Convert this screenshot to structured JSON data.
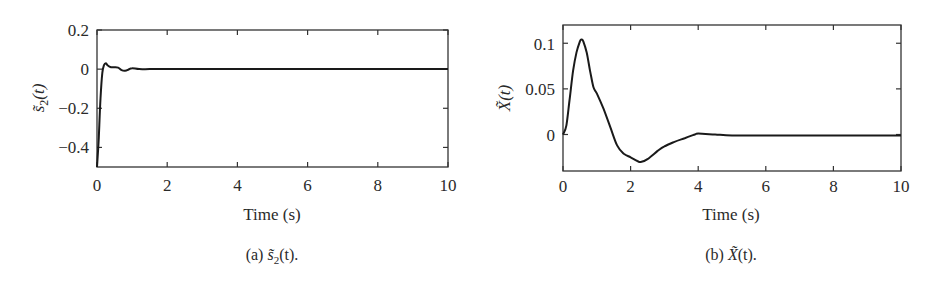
{
  "chart_data": [
    {
      "type": "line",
      "panel": "a",
      "caption": "(a) s̃2(t).",
      "caption_prefix": "(a)",
      "ylabel": "s̃2(t)",
      "xlabel": "Time (s)",
      "xlim": [
        0,
        10
      ],
      "ylim": [
        -0.5,
        0.2
      ],
      "xticks": [
        "0",
        "2",
        "4",
        "6",
        "8",
        "10"
      ],
      "yticks": [
        "0.2",
        "0",
        "-0.2",
        "-0.4"
      ],
      "grid": false,
      "series": [
        {
          "name": "s2_tilde",
          "x": [
            0,
            0.05,
            0.1,
            0.15,
            0.2,
            0.25,
            0.3,
            0.4,
            0.5,
            0.6,
            0.7,
            0.8,
            0.9,
            1.0,
            1.2,
            1.5,
            2,
            4,
            6,
            8,
            10
          ],
          "y": [
            -0.5,
            -0.35,
            -0.15,
            -0.02,
            0.02,
            0.03,
            0.02,
            0.01,
            0.01,
            0.008,
            -0.005,
            -0.008,
            -0.002,
            0.005,
            0.0,
            0.0,
            0.0,
            0.0,
            0.0,
            0.0,
            0.0
          ]
        }
      ]
    },
    {
      "type": "line",
      "panel": "b",
      "caption": "(b) X̃(t).",
      "caption_prefix": "(b)",
      "ylabel": "X̃(t)",
      "xlabel": "Time (s)",
      "xlim": [
        0,
        10
      ],
      "ylim": [
        -0.04,
        0.12
      ],
      "xticks": [
        "0",
        "2",
        "4",
        "6",
        "8",
        "10"
      ],
      "yticks": [
        "0.1",
        "0.05",
        "0"
      ],
      "grid": false,
      "series": [
        {
          "name": "X_tilde",
          "x": [
            0,
            0.1,
            0.2,
            0.3,
            0.4,
            0.5,
            0.55,
            0.6,
            0.7,
            0.8,
            0.9,
            1.0,
            1.2,
            1.4,
            1.6,
            1.8,
            2.0,
            2.2,
            2.3,
            2.5,
            2.8,
            3.0,
            3.3,
            3.6,
            3.9,
            4.0,
            4.5,
            5,
            6,
            7,
            8,
            9,
            10
          ],
          "y": [
            0.0,
            0.01,
            0.04,
            0.07,
            0.09,
            0.102,
            0.104,
            0.102,
            0.09,
            0.07,
            0.052,
            0.045,
            0.028,
            0.008,
            -0.012,
            -0.021,
            -0.025,
            -0.029,
            -0.03,
            -0.027,
            -0.018,
            -0.013,
            -0.008,
            -0.004,
            0.0,
            0.001,
            0.0,
            -0.001,
            -0.001,
            -0.001,
            -0.001,
            -0.001,
            -0.001
          ]
        }
      ]
    }
  ],
  "panels": {
    "a": {
      "xlabel": "Time (s)",
      "ylabel_main": "s̃",
      "ylabel_sub": "2",
      "ylabel_rest": "(t)",
      "caption_prefix": "(a) ",
      "caption_main": "s̃",
      "caption_sub": "2",
      "caption_rest": "(t).",
      "xticks": [
        "0",
        "2",
        "4",
        "6",
        "8",
        "10"
      ],
      "yticks": [
        "0.2",
        "0",
        "−0.2",
        "−0.4"
      ]
    },
    "b": {
      "xlabel": "Time (s)",
      "ylabel_main": "X̃",
      "ylabel_rest": "(t)",
      "caption_prefix": "(b) ",
      "caption_main": "X̃",
      "caption_rest": "(t).",
      "xticks": [
        "0",
        "2",
        "4",
        "6",
        "8",
        "10"
      ],
      "yticks": [
        "0.1",
        "0.05",
        "0"
      ]
    }
  }
}
